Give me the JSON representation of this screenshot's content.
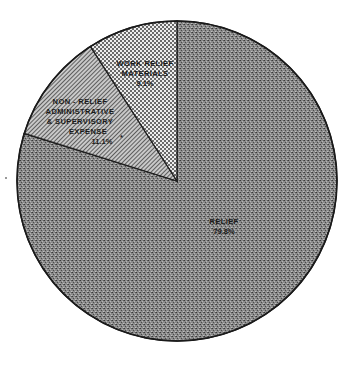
{
  "chart_data": {
    "type": "pie",
    "title": "",
    "start": "top",
    "direction": "clockwise",
    "slices": [
      {
        "name": "relief",
        "label_lines": [
          "RELIEF"
        ],
        "pct_text": "79.8%",
        "value": 79.8,
        "pattern": "dark-stipple",
        "color": "#7a7a7a"
      },
      {
        "name": "non-relief",
        "label_lines": [
          "NON - RELIEF",
          "ADMINISTRATIVE",
          "& SUPERVISORY",
          "EXPENSE"
        ],
        "pct_text": "11.1%",
        "footnote_mark": "*",
        "value": 11.1,
        "pattern": "diagonal-hatch",
        "color": "#a8a8a8"
      },
      {
        "name": "work-relief",
        "label_lines": [
          "WORK RELIEF",
          "MATERIALS"
        ],
        "pct_text": "9.1%",
        "value": 9.1,
        "pattern": "crosshatch",
        "color": "#d0d0d0"
      }
    ]
  }
}
